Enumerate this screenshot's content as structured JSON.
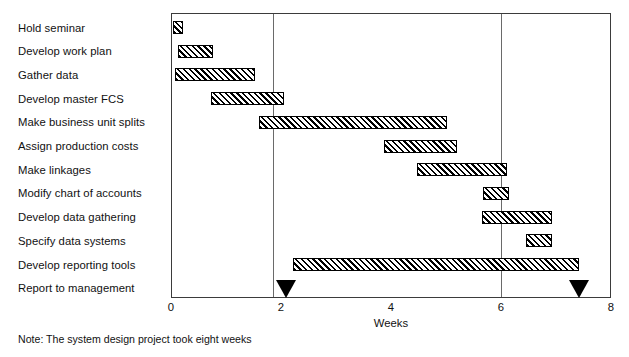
{
  "chart_data": {
    "type": "bar",
    "subtype": "gantt",
    "title": "",
    "xlabel": "Weeks",
    "ylabel": "",
    "xlim": [
      0,
      8
    ],
    "xticks": [
      0,
      2,
      4,
      6,
      8
    ],
    "xtick_labels": [
      "0",
      "2",
      "4",
      "6",
      "8"
    ],
    "gridlines_x": [
      2,
      6
    ],
    "grid": true,
    "legend": "none",
    "bar_fill": "diagonal-hatch",
    "categories": [
      "Hold seminar",
      "Develop work plan",
      "Gather data",
      "Develop master FCS",
      "Make business unit splits",
      "Assign production costs",
      "Make linkages",
      "Modify chart of accounts",
      "Develop data gathering",
      "Specify data systems",
      "Develop reporting tools",
      "Report to management"
    ],
    "tasks": [
      {
        "label": "Hold seminar",
        "start": 0.02,
        "end": 0.2
      },
      {
        "label": "Develop work plan",
        "start": 0.11,
        "end": 0.75
      },
      {
        "label": "Gather data",
        "start": 0.05,
        "end": 1.5
      },
      {
        "label": "Develop master FCS",
        "start": 0.71,
        "end": 2.04
      },
      {
        "label": "Make business unit splits",
        "start": 1.58,
        "end": 5.0
      },
      {
        "label": "Assign production costs",
        "start": 3.85,
        "end": 5.18
      },
      {
        "label": "Make linkages",
        "start": 4.45,
        "end": 6.09
      },
      {
        "label": "Modify chart of accounts",
        "start": 5.65,
        "end": 6.13
      },
      {
        "label": "Develop data gathering",
        "start": 5.64,
        "end": 6.91
      },
      {
        "label": "Specify data systems",
        "start": 6.44,
        "end": 6.91
      },
      {
        "label": "Develop reporting tools",
        "start": 2.2,
        "end": 7.4
      },
      {
        "label": "Report to management",
        "start": null,
        "end": null
      }
    ],
    "milestones": [
      {
        "label": "Report to management",
        "week": 2.07
      },
      {
        "label": "Report to management",
        "week": 7.4
      }
    ],
    "annotations": [
      "Note: The system design project took eight weeks"
    ]
  },
  "footnote": "Note: The system design project took eight weeks",
  "axis": {
    "title": "Weeks",
    "tick_labels": [
      "0",
      "2",
      "4",
      "6",
      "8"
    ]
  },
  "colors": {
    "bar_stroke": "#000000",
    "bar_hatch": "#000000",
    "frame": "#3b3b3b",
    "gridline": "#6a6a6a",
    "milestone": "#000000",
    "text": "#111111",
    "background": "#ffffff"
  }
}
